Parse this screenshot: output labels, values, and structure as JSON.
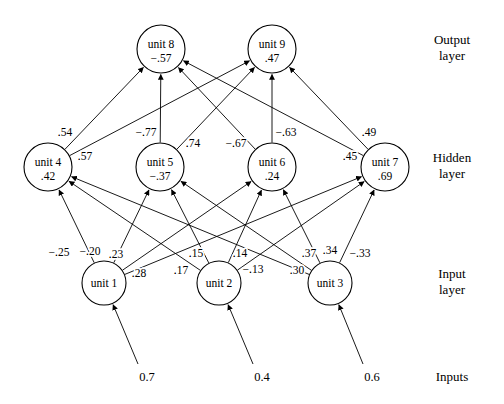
{
  "diagram": {
    "layer_labels": [
      {
        "name": "output",
        "line1": "Output",
        "line2": "layer"
      },
      {
        "name": "hidden",
        "line1": "Hidden",
        "line2": "layer"
      },
      {
        "name": "input",
        "line1": "Input",
        "line2": "layer"
      },
      {
        "name": "inputs",
        "line1": "Inputs",
        "line2": ""
      }
    ],
    "nodes": [
      {
        "id": "unit1",
        "label": "unit 1",
        "value": "",
        "cx": 104,
        "cy": 283,
        "r": 22,
        "layer": "input"
      },
      {
        "id": "unit2",
        "label": "unit 2",
        "value": "",
        "cx": 219,
        "cy": 283,
        "r": 22,
        "layer": "input"
      },
      {
        "id": "unit3",
        "label": "unit 3",
        "value": "",
        "cx": 330,
        "cy": 283,
        "r": 22,
        "layer": "input"
      },
      {
        "id": "unit4",
        "label": "unit 4",
        "value": ".42",
        "cx": 48,
        "cy": 167,
        "r": 24,
        "layer": "hidden"
      },
      {
        "id": "unit5",
        "label": "unit 5",
        "value": "−.37",
        "cx": 160,
        "cy": 167,
        "r": 24,
        "layer": "hidden"
      },
      {
        "id": "unit6",
        "label": "unit 6",
        "value": ".24",
        "cx": 272,
        "cy": 167,
        "r": 24,
        "layer": "hidden"
      },
      {
        "id": "unit7",
        "label": "unit 7",
        "value": ".69",
        "cx": 385,
        "cy": 167,
        "r": 24,
        "layer": "hidden"
      },
      {
        "id": "unit8",
        "label": "unit 8",
        "value": "−.57",
        "cx": 161,
        "cy": 49,
        "r": 24,
        "layer": "output"
      },
      {
        "id": "unit9",
        "label": "unit 9",
        "value": ".47",
        "cx": 272,
        "cy": 49,
        "r": 24,
        "layer": "output"
      }
    ],
    "inputs": [
      {
        "name": "input-1",
        "value": "0.7",
        "x": 147,
        "y": 381,
        "to": "unit1",
        "from_x": 138,
        "from_y": 364
      },
      {
        "name": "input-2",
        "value": "0.4",
        "x": 262,
        "y": 381,
        "to": "unit2",
        "from_x": 253,
        "from_y": 364
      },
      {
        "name": "input-3",
        "value": "0.6",
        "x": 372,
        "y": 381,
        "to": "unit3",
        "from_x": 363,
        "from_y": 364
      }
    ],
    "edges": [
      {
        "from": "unit1",
        "to": "unit4"
      },
      {
        "from": "unit1",
        "to": "unit5"
      },
      {
        "from": "unit1",
        "to": "unit6"
      },
      {
        "from": "unit1",
        "to": "unit7"
      },
      {
        "from": "unit2",
        "to": "unit4"
      },
      {
        "from": "unit2",
        "to": "unit5"
      },
      {
        "from": "unit2",
        "to": "unit6"
      },
      {
        "from": "unit2",
        "to": "unit7"
      },
      {
        "from": "unit3",
        "to": "unit4"
      },
      {
        "from": "unit3",
        "to": "unit5"
      },
      {
        "from": "unit3",
        "to": "unit6"
      },
      {
        "from": "unit3",
        "to": "unit7"
      },
      {
        "from": "unit4",
        "to": "unit8"
      },
      {
        "from": "unit4",
        "to": "unit9"
      },
      {
        "from": "unit5",
        "to": "unit8"
      },
      {
        "from": "unit5",
        "to": "unit9"
      },
      {
        "from": "unit6",
        "to": "unit8"
      },
      {
        "from": "unit6",
        "to": "unit9"
      },
      {
        "from": "unit7",
        "to": "unit8"
      },
      {
        "from": "unit7",
        "to": "unit9"
      }
    ],
    "weights": [
      {
        "name": "w-unit1-unit4",
        "text": "−.25",
        "x": 59,
        "y": 256
      },
      {
        "name": "w-unit1-unit5",
        "text": "−.20",
        "x": 90,
        "y": 255
      },
      {
        "name": "w-unit1-unit6",
        "text": ".23",
        "x": 116,
        "y": 258
      },
      {
        "name": "w-unit1-unit7",
        "text": ".28",
        "x": 139,
        "y": 277
      },
      {
        "name": "w-unit2-unit4",
        "text": ".17",
        "x": 181,
        "y": 274
      },
      {
        "name": "w-unit2-unit5",
        "text": ".15",
        "x": 196,
        "y": 257
      },
      {
        "name": "w-unit2-unit6",
        "text": ".14",
        "x": 240,
        "y": 257
      },
      {
        "name": "w-unit2-unit7",
        "text": "−.13",
        "x": 253,
        "y": 273
      },
      {
        "name": "w-unit3-unit4",
        "text": ".30",
        "x": 297,
        "y": 274
      },
      {
        "name": "w-unit3-unit5",
        "text": ".37",
        "x": 309,
        "y": 257
      },
      {
        "name": "w-unit3-unit6",
        "text": ".34",
        "x": 330,
        "y": 254
      },
      {
        "name": "w-unit3-unit7",
        "text": "−.33",
        "x": 360,
        "y": 257
      },
      {
        "name": "w-unit4-unit8",
        "text": ".54",
        "x": 65,
        "y": 136
      },
      {
        "name": "w-unit4-unit9",
        "text": ".57",
        "x": 85,
        "y": 160
      },
      {
        "name": "w-unit5-unit8",
        "text": "−.77",
        "x": 146,
        "y": 136
      },
      {
        "name": "w-unit5-unit9",
        "text": ".74",
        "x": 193,
        "y": 147
      },
      {
        "name": "w-unit6-unit8",
        "text": "−.67",
        "x": 236,
        "y": 147
      },
      {
        "name": "w-unit6-unit9",
        "text": "−.63",
        "x": 286,
        "y": 136
      },
      {
        "name": "w-unit7-unit8",
        "text": ".45",
        "x": 350,
        "y": 160
      },
      {
        "name": "w-unit7-unit9",
        "text": ".49",
        "x": 369,
        "y": 136
      }
    ]
  }
}
